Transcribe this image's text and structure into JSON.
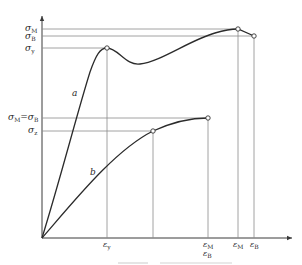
{
  "diagram": {
    "type": "stress-strain",
    "y_labels": {
      "sigma_M": {
        "symbol": "σ",
        "sub": "M"
      },
      "sigma_B": {
        "symbol": "σ",
        "sub": "B"
      },
      "sigma_y": {
        "symbol": "σ",
        "sub": "y"
      },
      "sigma_MB": {
        "left": "σ",
        "left_sub": "M",
        "eq": "=",
        "right": "σ",
        "right_sub": "B"
      },
      "sigma_z": {
        "symbol": "σ",
        "sub": "z"
      }
    },
    "x_labels": {
      "eps_y": {
        "symbol": "ε",
        "sub": "y"
      },
      "eps_M_b": {
        "symbol": "ε",
        "sub": "M"
      },
      "eps_B_b": {
        "symbol": "ε",
        "sub": "B"
      },
      "eps_M_a": {
        "symbol": "ε",
        "sub": "M"
      },
      "eps_B_a": {
        "symbol": "ε",
        "sub": "B"
      }
    },
    "curves": [
      {
        "name": "a",
        "label": "a",
        "description": "ductile material with yield point, drop, hardening, max then break"
      },
      {
        "name": "b",
        "label": "b",
        "description": "material without yield, max coincides with break"
      }
    ]
  }
}
